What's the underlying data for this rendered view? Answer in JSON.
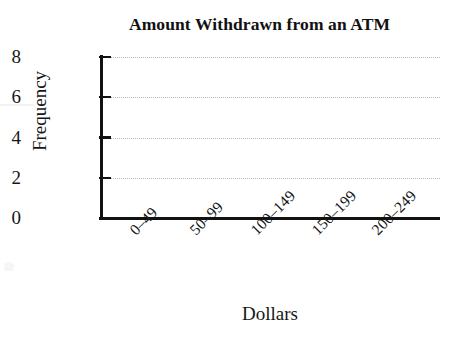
{
  "chart_data": {
    "type": "bar",
    "title": "Amount Withdrawn from an ATM",
    "xlabel": "Dollars",
    "ylabel": "Frequency",
    "categories": [
      "0–49",
      "50–99",
      "100–149",
      "150–199",
      "200–249"
    ],
    "values": [
      null,
      null,
      null,
      null,
      null
    ],
    "ylim": [
      0,
      8
    ],
    "y_ticks": [
      "0",
      "2",
      "4",
      "6",
      "8"
    ],
    "y_tick_values": [
      0,
      2,
      4,
      6,
      8
    ],
    "grid": "horizontal-dotted",
    "legend": "none",
    "note": "blank histogram template; no bars plotted",
    "colors": {
      "axis": "#111111",
      "gridline": "#b9b9b9",
      "text": "#161616",
      "background": "#ffffff"
    }
  },
  "figure": {
    "title": "Amount Withdrawn from an ATM",
    "x_axis_title": "Dollars",
    "y_axis_title": "Frequency"
  }
}
